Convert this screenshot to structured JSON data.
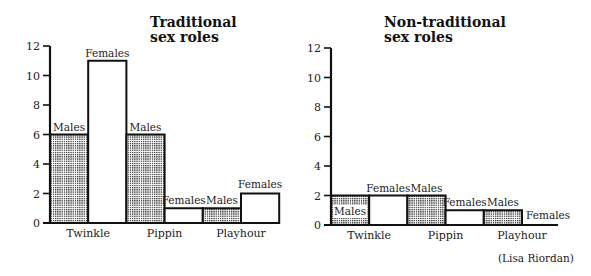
{
  "chart_data": [
    {
      "type": "bar",
      "title": "Traditional sex roles",
      "title_lines": [
        "Traditional",
        "sex roles"
      ],
      "categories": [
        "Twinkle",
        "Pippin",
        "Playhour"
      ],
      "series": [
        {
          "name": "Males",
          "values": [
            6,
            6,
            1
          ],
          "fill": "dotted"
        },
        {
          "name": "Females",
          "values": [
            11,
            1,
            2
          ],
          "fill": "white"
        }
      ],
      "xlabel": "",
      "ylabel": "",
      "ylim": [
        0,
        12
      ],
      "yticks": [
        0,
        2,
        4,
        6,
        8,
        10,
        12
      ],
      "grid": false,
      "legend": "none (bars labelled directly)"
    },
    {
      "type": "bar",
      "title": "Non-traditional sex roles",
      "title_lines": [
        "Non-traditional",
        "sex roles"
      ],
      "categories": [
        "Twinkle",
        "Pippin",
        "Playhour"
      ],
      "series": [
        {
          "name": "Males",
          "values": [
            2,
            2,
            1
          ],
          "fill": "dotted"
        },
        {
          "name": "Females",
          "values": [
            2,
            1,
            0
          ],
          "fill": "white"
        }
      ],
      "xlabel": "",
      "ylabel": "",
      "ylim": [
        0,
        12
      ],
      "yticks": [
        0,
        2,
        4,
        6,
        8,
        10,
        12
      ],
      "grid": false,
      "legend": "none (bars labelled directly)"
    }
  ],
  "labels": {
    "males": "Males",
    "females": "Females"
  },
  "credit": "(Lisa Riordan)"
}
